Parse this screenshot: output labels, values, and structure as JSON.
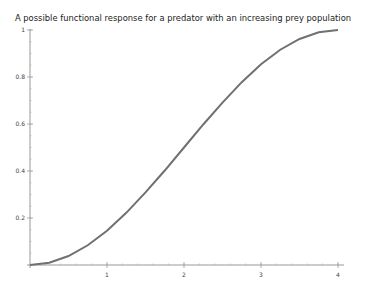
{
  "chart_data": {
    "type": "line",
    "title": "A possible functional response for a predator with an increasing prey population",
    "xlabel": "",
    "ylabel": "",
    "xlim": [
      0,
      4
    ],
    "ylim": [
      0,
      1
    ],
    "grid": false,
    "legend": null,
    "x_ticks": [
      1,
      2,
      3,
      4
    ],
    "x_tick_labels": [
      "1",
      "2",
      "3",
      "4"
    ],
    "y_ticks": [
      0.2,
      0.4,
      0.6,
      0.8,
      1
    ],
    "y_tick_labels": [
      "0.2",
      "0.4",
      "0.6",
      "0.8",
      "1"
    ],
    "series": [
      {
        "name": "functional response",
        "color": "#707070",
        "x": [
          0,
          0.25,
          0.5,
          0.75,
          1,
          1.25,
          1.5,
          1.75,
          2,
          2.25,
          2.5,
          2.75,
          3,
          3.25,
          3.5,
          3.75,
          4
        ],
        "y": [
          0,
          0.01,
          0.038,
          0.084,
          0.146,
          0.222,
          0.309,
          0.402,
          0.5,
          0.598,
          0.691,
          0.778,
          0.854,
          0.916,
          0.962,
          0.99,
          1
        ]
      }
    ]
  },
  "title": "A possible functional response for a predator with an increasing prey population"
}
